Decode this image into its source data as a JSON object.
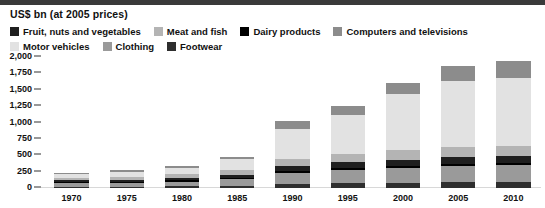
{
  "units_caption": "US$ bn (at 2005 prices)",
  "colors": {
    "fruit_nuts_vegetables": "#1f1f1f",
    "meat_and_fish": "#b4b4b4",
    "dairy_products": "#000000",
    "computers_and_televisions": "#8c8c8c",
    "motor_vehicles": "#e2e2e2",
    "clothing": "#9a9a9a",
    "footwear": "#2e2e2e",
    "axis": "#333333",
    "top_rule": "#3a3a3a"
  },
  "legend": {
    "rows": [
      [
        {
          "label": "Fruit, nuts and vegetables",
          "key": "fruit_nuts_vegetables"
        },
        {
          "label": "Meat and fish",
          "key": "meat_and_fish"
        },
        {
          "label": "Dairy products",
          "key": "dairy_products"
        },
        {
          "label": "Computers and televisions",
          "key": "computers_and_televisions"
        }
      ],
      [
        {
          "label": "Motor vehicles",
          "key": "motor_vehicles"
        },
        {
          "label": "Clothing",
          "key": "clothing"
        },
        {
          "label": "Footwear",
          "key": "footwear"
        }
      ]
    ]
  },
  "chart_data": {
    "type": "bar",
    "stacked": true,
    "title": "",
    "subtitle": "",
    "xlabel": "",
    "ylabel": "US$ bn (at 2005 prices)",
    "ylim": [
      0,
      2000
    ],
    "yticks": [
      0,
      250,
      500,
      750,
      1000,
      1250,
      1500,
      1750,
      2000
    ],
    "ytick_labels": [
      "0",
      "250",
      "500",
      "750",
      "1,000",
      "1,250",
      "1,500",
      "1,750",
      "2,000"
    ],
    "grid": false,
    "legend_position": "top",
    "categories": [
      "1970",
      "1975",
      "1980",
      "1985",
      "1990",
      "1995",
      "2000",
      "2005",
      "2010"
    ],
    "series": [
      {
        "name": "Footwear",
        "key": "footwear",
        "values": [
          18,
          20,
          24,
          32,
          60,
          70,
          80,
          90,
          95
        ]
      },
      {
        "name": "Clothing",
        "key": "clothing",
        "values": [
          55,
          62,
          75,
          105,
          175,
          210,
          230,
          250,
          255
        ]
      },
      {
        "name": "Dairy products",
        "key": "dairy_products",
        "values": [
          14,
          15,
          17,
          20,
          28,
          30,
          32,
          34,
          35
        ]
      },
      {
        "name": "Fruit, nuts and vegetables",
        "key": "fruit_nuts_vegetables",
        "values": [
          30,
          33,
          38,
          48,
          70,
          80,
          88,
          95,
          98
        ]
      },
      {
        "name": "Meat and fish",
        "key": "meat_and_fish",
        "values": [
          40,
          45,
          55,
          70,
          110,
          130,
          145,
          158,
          162
        ]
      },
      {
        "name": "Motor vehicles",
        "key": "motor_vehicles",
        "values": [
          58,
          75,
          95,
          165,
          465,
          600,
          860,
          1005,
          1030
        ]
      },
      {
        "name": "Computers and televisions",
        "key": "computers_and_televisions",
        "values": [
          15,
          20,
          26,
          40,
          122,
          140,
          165,
          238,
          265
        ]
      }
    ],
    "totals": [
      230,
      270,
      330,
      480,
      1030,
      1260,
      1600,
      1870,
      1940
    ]
  }
}
